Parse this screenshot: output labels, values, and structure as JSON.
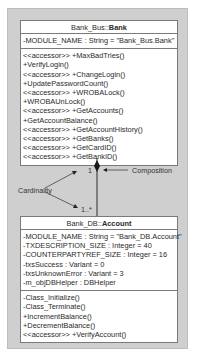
{
  "bank_class": {
    "namespace": "Bank_Bus::",
    "name": "Bank",
    "attributes": [
      "-MODULE_NAME : String = \"Bank_Bus.Bank\""
    ],
    "methods": [
      "<<accessor>> +MaxBadTries()",
      "+VerifyLogin()",
      "<<accessor>> +ChangeLogin()",
      "+UpdatePasswordCount()",
      "<<accessor>> +WROBALock()",
      "+WROBAUnLock()",
      "<<accessor>> +GetAccounts()",
      "+GetAccountBalance()",
      "<<accessor>> +GetAccountHistory()",
      "<<accessor>> +GetBanks()",
      "<<accessor>> +GetCardID()",
      "<<accessor>> +GetBankID()"
    ]
  },
  "account_class": {
    "namespace": "Bank_DB::",
    "name": "Account",
    "attributes": [
      "-MODULE_NAME : String = \"Bank_DB.Account\"",
      "-TXDESCRIPTION_SIZE : Integer = 40",
      "-COUNTERPARTYREF_SIZE : Integer = 16",
      "-txsSuccess : Variant = 0",
      "-txsUnknownError : Variant = 3",
      "-m_objDBHelper : DBHelper"
    ],
    "methods": [
      "-Class_Initialize()",
      "-Class_Terminate()",
      "+IncrementBalance()",
      "+DecrementBalance()",
      "<<accessor>> +VerifyAccount()"
    ]
  },
  "association": {
    "type": "composition",
    "top_multiplicity": "1",
    "bottom_multiplicity": "1..*",
    "composition_label": "Composition",
    "cardinality_label": "Cardinality"
  },
  "colors": {
    "panel": "#cfcfcf",
    "box": "#ffffff",
    "line": "#2a2a2a"
  }
}
